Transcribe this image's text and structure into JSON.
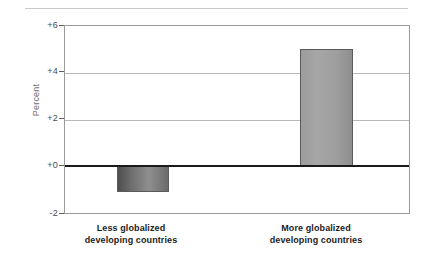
{
  "chart_data": {
    "type": "bar",
    "title": "",
    "subtitle": "",
    "xlabel": "",
    "ylabel": "Percent",
    "ylim": [
      -2,
      6
    ],
    "yticks": [
      "+6",
      "+4",
      "+2",
      "+0",
      "-2"
    ],
    "ytick_values": [
      6,
      4,
      2,
      0,
      -2
    ],
    "grid": true,
    "legend": null,
    "categories": [
      "Less globalized developing countries",
      "More globalized developing countries"
    ],
    "category_lines": [
      [
        "Less globalized",
        "developing countries"
      ],
      [
        "More globalized",
        "developing countries"
      ]
    ],
    "values": [
      -1.1,
      5.0
    ],
    "bar_colors": [
      "#6f6f6f",
      "#a0a0a0"
    ],
    "zero_line_color": "#1a1a1a",
    "grid_color": "#b9b9b9",
    "axis_color": "#9a9a9a"
  },
  "figure": {
    "background_color": "#ffffff",
    "separator_color": "#c8c8c8"
  }
}
